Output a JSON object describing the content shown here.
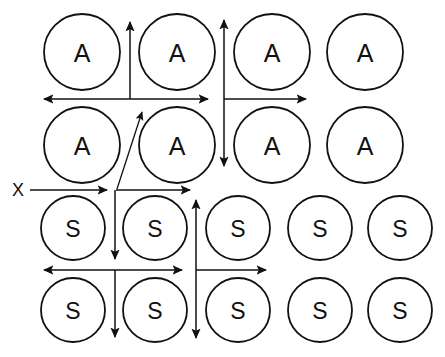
{
  "figure": {
    "canvas": {
      "width": 445,
      "height": 357,
      "background": "#ffffff"
    },
    "stroke_color": "#111111",
    "circle_fill": "#ffffff",
    "axis_label": "X",
    "axis_label_position": {
      "x": 18,
      "y": 190
    },
    "rows": [
      {
        "id": "row-a-1",
        "label": "A",
        "radius": 38,
        "cy": 52,
        "centers": [
          82,
          177,
          272,
          365
        ]
      },
      {
        "id": "row-a-2",
        "label": "A",
        "radius": 38,
        "cy": 145,
        "centers": [
          82,
          177,
          272,
          365
        ]
      },
      {
        "id": "row-s-1",
        "label": "S",
        "radius": 32,
        "cy": 228,
        "centers": [
          73,
          155,
          238,
          320,
          400
        ]
      },
      {
        "id": "row-s-2",
        "label": "S",
        "radius": 32,
        "cy": 310,
        "centers": [
          73,
          155,
          238,
          320,
          400
        ]
      }
    ],
    "flux_arrows": [
      {
        "id": "h-boundary-upper-left",
        "orientation": "horizontal",
        "x1": 44,
        "y1": 99,
        "x2": 208,
        "y2": 99,
        "head_start": true,
        "head_end": true
      },
      {
        "id": "h-boundary-upper-right",
        "orientation": "horizontal",
        "x1": 224,
        "y1": 99,
        "x2": 306,
        "y2": 99,
        "head_start": false,
        "head_end": true
      },
      {
        "id": "h-boundary-middle-left",
        "orientation": "horizontal",
        "x1": 30,
        "y1": 190,
        "x2": 107,
        "y2": 190,
        "head_start": false,
        "head_end": true
      },
      {
        "id": "h-boundary-middle-right",
        "orientation": "horizontal",
        "x1": 116,
        "y1": 190,
        "x2": 190,
        "y2": 190,
        "head_start": false,
        "head_end": true
      },
      {
        "id": "h-boundary-lower-left",
        "orientation": "horizontal",
        "x1": 44,
        "y1": 270,
        "x2": 182,
        "y2": 270,
        "head_start": true,
        "head_end": true
      },
      {
        "id": "h-boundary-lower-right",
        "orientation": "horizontal",
        "x1": 196,
        "y1": 270,
        "x2": 266,
        "y2": 270,
        "head_start": false,
        "head_end": true
      },
      {
        "id": "v-boundary-top-short",
        "orientation": "vertical",
        "x1": 130,
        "y1": 99,
        "x2": 130,
        "y2": 22,
        "head_start": false,
        "head_end": true
      },
      {
        "id": "v-boundary-column-two",
        "orientation": "vertical",
        "x1": 224,
        "y1": 20,
        "x2": 224,
        "y2": 166,
        "head_start": true,
        "head_end": true
      },
      {
        "id": "v-boundary-mid-down-upper",
        "orientation": "vertical",
        "x1": 115,
        "y1": 190,
        "x2": 115,
        "y2": 259,
        "head_start": false,
        "head_end": true
      },
      {
        "id": "v-boundary-mid-down-lower",
        "orientation": "vertical",
        "x1": 115,
        "y1": 270,
        "x2": 115,
        "y2": 337,
        "head_start": false,
        "head_end": true
      },
      {
        "id": "v-boundary-column-three",
        "orientation": "vertical",
        "x1": 196,
        "y1": 200,
        "x2": 196,
        "y2": 338,
        "head_start": true,
        "head_end": true
      },
      {
        "id": "diagonal-grain-boundary",
        "orientation": "diagonal",
        "x1": 117,
        "y1": 189,
        "x2": 142,
        "y2": 112,
        "head_start": false,
        "head_end": true
      }
    ]
  }
}
